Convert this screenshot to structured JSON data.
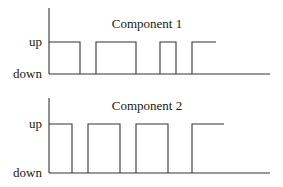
{
  "diagram": {
    "type": "timing-diagram",
    "panels": [
      {
        "title": "Component 1",
        "y_labels": {
          "high": "up",
          "low": "down"
        },
        "geometry": {
          "axis_x": 49,
          "axis_top": 8,
          "up_y": 42,
          "down_y": 74,
          "baseline_end": 270,
          "title_x": 147,
          "title_y": 28
        },
        "states": [
          {
            "state": "up",
            "from": 49,
            "to": 80
          },
          {
            "state": "down",
            "from": 80,
            "to": 96
          },
          {
            "state": "up",
            "from": 96,
            "to": 136
          },
          {
            "state": "down",
            "from": 136,
            "to": 160
          },
          {
            "state": "up",
            "from": 160,
            "to": 176
          },
          {
            "state": "down",
            "from": 176,
            "to": 192
          },
          {
            "state": "up",
            "from": 192,
            "to": 216
          }
        ]
      },
      {
        "title": "Component 2",
        "y_labels": {
          "high": "up",
          "low": "down"
        },
        "geometry": {
          "axis_x": 49,
          "axis_top": 98,
          "up_y": 124,
          "down_y": 173,
          "baseline_end": 270,
          "title_x": 147,
          "title_y": 110
        },
        "states": [
          {
            "state": "up",
            "from": 49,
            "to": 72
          },
          {
            "state": "down",
            "from": 72,
            "to": 88
          },
          {
            "state": "up",
            "from": 88,
            "to": 120
          },
          {
            "state": "down",
            "from": 120,
            "to": 136
          },
          {
            "state": "up",
            "from": 136,
            "to": 168
          },
          {
            "state": "down",
            "from": 168,
            "to": 192
          },
          {
            "state": "up",
            "from": 192,
            "to": 224
          }
        ]
      }
    ]
  }
}
